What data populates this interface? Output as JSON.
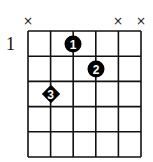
{
  "diagram": {
    "type": "guitar-chord",
    "strings": 6,
    "frets_shown": 5,
    "start_fret_label": "1",
    "muted_strings": [
      1,
      5,
      6
    ],
    "mute_symbol": "×",
    "fingers": [
      {
        "finger": "1",
        "string": 3,
        "fret": 1,
        "shape": "circle"
      },
      {
        "finger": "2",
        "string": 4,
        "fret": 2,
        "shape": "circle"
      },
      {
        "finger": "3",
        "string": 2,
        "fret": 3,
        "shape": "diamond"
      }
    ]
  }
}
